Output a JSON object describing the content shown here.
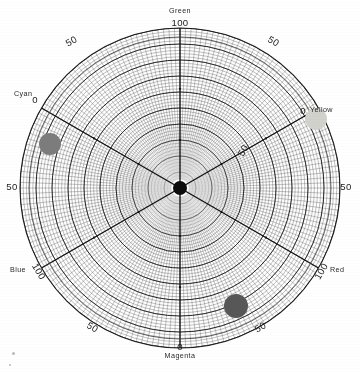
{
  "chart_data": {
    "type": "scatter",
    "title": "",
    "subtitle": "",
    "projection": "polar",
    "center": {
      "x": 180,
      "y": 188,
      "label": "center-point"
    },
    "radius_px": 160,
    "radial_range": [
      0,
      100
    ],
    "grid": {
      "on": true,
      "radial_rings_minor": 50,
      "radial_rings_major": 10,
      "angular_lines_minor": 180,
      "angular_lines_major": 6,
      "line_color": "#4a4a4a"
    },
    "axes": [
      {
        "name": "Green",
        "angle_deg": 90,
        "tick_value": "100",
        "label_pos": "top"
      },
      {
        "name": "Yellow",
        "angle_deg": 30,
        "tick_value": "0",
        "label_pos": "upper-right"
      },
      {
        "name": "Red",
        "angle_deg": -30,
        "tick_value": "100",
        "label_pos": "lower-right"
      },
      {
        "name": "Magenta",
        "angle_deg": -90,
        "tick_value": "0",
        "label_pos": "bottom"
      },
      {
        "name": "Blue",
        "angle_deg": -150,
        "tick_value": "100",
        "label_pos": "lower-left"
      },
      {
        "name": "Cyan",
        "angle_deg": 150,
        "tick_value": "0",
        "label_pos": "upper-left"
      }
    ],
    "perimeter_ticks": [
      {
        "value": "50",
        "angle_deg": 120,
        "rotation_deg": -30
      },
      {
        "value": "50",
        "angle_deg": 60,
        "rotation_deg": 30
      },
      {
        "value": "50",
        "angle_deg": 0,
        "rotation_deg": 0
      },
      {
        "value": "50",
        "angle_deg": -60,
        "rotation_deg": -30
      },
      {
        "value": "50",
        "angle_deg": -120,
        "rotation_deg": 30
      },
      {
        "value": "50",
        "angle_deg": 180,
        "rotation_deg": 0
      }
    ],
    "interior_ticks": [
      {
        "value": "50",
        "angle_deg": 30,
        "radius_frac": 0.46,
        "rotation_deg": -60
      }
    ],
    "points": [
      {
        "name": "sample-cyan",
        "color": "#7c7c7c",
        "x": 50,
        "y": 144,
        "r": 11,
        "toward_axis": "Cyan",
        "radius_frac": 0.84,
        "angle_deg": 164
      },
      {
        "name": "sample-yellow",
        "color": "#d2d2cc",
        "x": 316,
        "y": 119,
        "r": 11,
        "toward_axis": "Yellow",
        "radius_frac": 0.9,
        "angle_deg": 24
      },
      {
        "name": "sample-magenta",
        "color": "#575757",
        "x": 236,
        "y": 306,
        "r": 12,
        "toward_axis": "Magenta",
        "radius_frac": 0.82,
        "angle_deg": -59
      },
      {
        "name": "origin-point",
        "color": "#0d0d0d",
        "x": 180,
        "y": 188,
        "r": 7,
        "toward_axis": "center",
        "radius_frac": 0.0,
        "angle_deg": 0
      }
    ],
    "legend": {
      "visible": false,
      "position": "none"
    },
    "xlabel": "",
    "ylabel": ""
  },
  "labels": {
    "green": "Green",
    "yellow": "Yellow",
    "red": "Red",
    "magenta": "Magenta",
    "blue": "Blue",
    "cyan": "Cyan",
    "tick_green_100": "100",
    "tick_yellow_0": "0",
    "tick_red_100": "100",
    "tick_magenta_0": "0",
    "tick_blue_100": "100",
    "tick_cyan_0": "0",
    "tick_50_a": "50",
    "tick_50_b": "50",
    "tick_50_left": "50",
    "tick_50_right": "50",
    "tick_50_c": "50",
    "tick_50_d": "50",
    "tick_50_inner": "50"
  },
  "colors": {
    "background": "#ffffff",
    "grid": "#4a4a4a",
    "grid_major": "#1e1e1e",
    "text": "#1c1c1c",
    "point_cyan": "#7c7c7c",
    "point_yellow": "#d2d2cc",
    "point_magenta": "#575757",
    "point_center": "#0d0d0d"
  }
}
